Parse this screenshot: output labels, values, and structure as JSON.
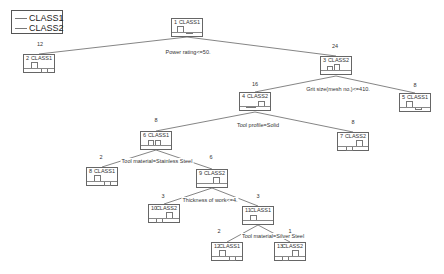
{
  "legend": {
    "items": [
      {
        "label": "CLASS1"
      },
      {
        "label": "CLASS2"
      }
    ]
  },
  "nodes": [
    {
      "id": "1",
      "label": "1",
      "class": "CLASS1",
      "x": 171,
      "y": 18,
      "count": ""
    },
    {
      "id": "2",
      "label": "2",
      "class": "CLASS1",
      "x": 23,
      "y": 54,
      "count": "12"
    },
    {
      "id": "3",
      "label": "3",
      "class": "CLASS2",
      "x": 320,
      "y": 56,
      "count": "24"
    },
    {
      "id": "4",
      "label": "4",
      "class": "CLASS2",
      "x": 239,
      "y": 92,
      "count": "16"
    },
    {
      "id": "5",
      "label": "5",
      "class": "CLASS1",
      "x": 399,
      "y": 93,
      "count": "8"
    },
    {
      "id": "6",
      "label": "6",
      "class": "CLASS1",
      "x": 140,
      "y": 131,
      "count": "8"
    },
    {
      "id": "7",
      "label": "7",
      "class": "CLASS2",
      "x": 337,
      "y": 132,
      "count": "8"
    },
    {
      "id": "8",
      "label": "8",
      "class": "CLASS1",
      "x": 86,
      "y": 167,
      "count": "2"
    },
    {
      "id": "9",
      "label": "9",
      "class": "CLASS2",
      "x": 196,
      "y": 169,
      "count": "6"
    },
    {
      "id": "10",
      "label": "10",
      "class": "CLASS2",
      "x": 148,
      "y": 204,
      "count": "3"
    },
    {
      "id": "11",
      "label": "11",
      "class": "CLASS1",
      "x": 242,
      "y": 206,
      "count": "3"
    },
    {
      "id": "12",
      "label": "12",
      "class": "CLASS1",
      "x": 211,
      "y": 242,
      "count": "2"
    },
    {
      "id": "13",
      "label": "13",
      "class": "CLASS2",
      "x": 274,
      "y": 242,
      "count": "1"
    }
  ],
  "edges": [
    {
      "from": "1",
      "to": "2"
    },
    {
      "from": "1",
      "to": "3"
    },
    {
      "from": "3",
      "to": "4"
    },
    {
      "from": "3",
      "to": "5"
    },
    {
      "from": "4",
      "to": "6"
    },
    {
      "from": "4",
      "to": "7"
    },
    {
      "from": "6",
      "to": "8"
    },
    {
      "from": "6",
      "to": "9"
    },
    {
      "from": "9",
      "to": "10"
    },
    {
      "from": "9",
      "to": "11"
    },
    {
      "from": "11",
      "to": "12"
    },
    {
      "from": "11",
      "to": "13"
    }
  ],
  "splits": [
    {
      "node": "1",
      "text": "Power rating<=50."
    },
    {
      "node": "3",
      "text": "Grit size(mesh no.)<=410."
    },
    {
      "node": "4",
      "text": "Tool profile=Solid"
    },
    {
      "node": "6",
      "text": "Tool material=Stainless Steel"
    },
    {
      "node": "9",
      "text": "Thickness of work<=4."
    },
    {
      "node": "11",
      "text": "Tool material=Silver Steel"
    }
  ],
  "counts": {
    "n2": "12",
    "n3": "24",
    "n4": "16",
    "n5": "8",
    "n6": "8",
    "n7": "8",
    "n8": "2",
    "n9": "6",
    "n10": "3",
    "n11": "3",
    "n12": "2",
    "n13": "1"
  },
  "colors": {
    "line": "#666666",
    "border": "#666666",
    "text": "#333333",
    "background": "#ffffff"
  }
}
